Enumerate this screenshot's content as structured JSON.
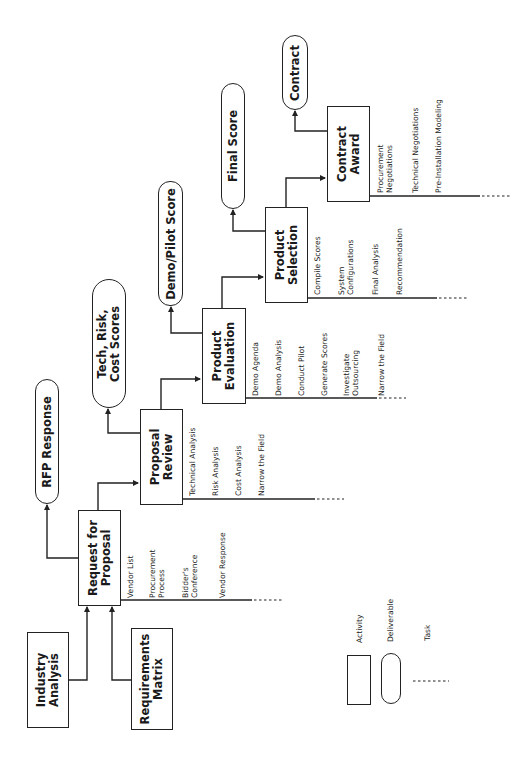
{
  "activities": [
    {
      "id": "industry-analysis",
      "label": "Industry\nAnalysis",
      "lines": [
        "Industry",
        "Analysis"
      ]
    },
    {
      "id": "requirements-matrix",
      "label": "Requirements\nMatrix",
      "lines": [
        "Requirements",
        "Matrix"
      ]
    },
    {
      "id": "request-for-proposal",
      "lines": [
        "Request for",
        "Proposal"
      ],
      "tasks": [
        "Vendor List",
        "Procurement\nProcess",
        "Bidder's\nConference",
        "Vendor Response"
      ]
    },
    {
      "id": "proposal-review",
      "lines": [
        "Proposal",
        "Review"
      ],
      "tasks": [
        "Technical Analysis",
        "Risk Analysis",
        "Cost Analysis",
        "Narrow the Field"
      ]
    },
    {
      "id": "product-evaluation",
      "lines": [
        "Product",
        "Evaluation"
      ],
      "tasks": [
        "Demo Agenda",
        "Demo Analysis",
        "Conduct Pilot",
        "Generate Scores",
        "Investigate\nOutsourcing",
        "Narrow the Field"
      ]
    },
    {
      "id": "product-selection",
      "lines": [
        "Product",
        "Selection"
      ],
      "tasks": [
        "Compile Scores",
        "System\nConfigurations",
        "Final Analysis",
        "Recommendation"
      ]
    },
    {
      "id": "contract-award",
      "lines": [
        "Contract",
        "Award"
      ],
      "tasks": [
        "Procurement\nNegotiations",
        "Technical Negotiations",
        "Pre-Installation Modeling"
      ]
    }
  ],
  "deliverables": [
    {
      "id": "rfp-response",
      "lines": [
        "RFP Response"
      ]
    },
    {
      "id": "tech-risk-cost-scores",
      "lines": [
        "Tech, Risk,",
        "Cost Scores"
      ]
    },
    {
      "id": "demo-pilot-score",
      "lines": [
        "Demo/Pilot Score"
      ]
    },
    {
      "id": "final-score",
      "lines": [
        "Final Score"
      ]
    },
    {
      "id": "contract",
      "lines": [
        "Contract"
      ]
    }
  ],
  "tasks": {
    "rfp": {
      "t0": "Vendor List",
      "t1a": "Procurement",
      "t1b": "Process",
      "t2a": "Bidder's",
      "t2b": "Conference",
      "t3": "Vendor Response"
    },
    "pr": {
      "t0": "Technical Analysis",
      "t1": "Risk Analysis",
      "t2": "Cost Analysis",
      "t3": "Narrow the Field"
    },
    "pe": {
      "t0": "Demo Agenda",
      "t1": "Demo Analysis",
      "t2": "Conduct Pilot",
      "t3": "Generate Scores",
      "t4a": "Investigate",
      "t4b": "Outsourcing",
      "t5": "Narrow the Field"
    },
    "ps": {
      "t0": "Compile Scores",
      "t1a": "System",
      "t1b": "Configurations",
      "t2": "Final Analysis",
      "t3": "Recommendation"
    },
    "ca": {
      "t0a": "Procurement",
      "t0b": "Negotiations",
      "t1": "Technical Negotiations",
      "t2": "Pre-Installation Modeling"
    }
  },
  "labels": {
    "industry_analysis_1": "Industry",
    "industry_analysis_2": "Analysis",
    "requirements_matrix_1": "Requirements",
    "requirements_matrix_2": "Matrix",
    "rfp_1": "Request for",
    "rfp_2": "Proposal",
    "proposal_review_1": "Proposal",
    "proposal_review_2": "Review",
    "product_evaluation_1": "Product",
    "product_evaluation_2": "Evaluation",
    "product_selection_1": "Product",
    "product_selection_2": "Selection",
    "contract_award_1": "Contract",
    "contract_award_2": "Award",
    "rfp_response": "RFP Response",
    "tech_scores_1": "Tech, Risk,",
    "tech_scores_2": "Cost Scores",
    "demo_pilot_score": "Demo/Pilot Score",
    "final_score": "Final Score",
    "contract": "Contract"
  },
  "legend": {
    "activity": "Activity",
    "deliverable": "Deliverable",
    "task": "Task"
  },
  "colors": {
    "line": "#222222",
    "background": "#ffffff"
  }
}
